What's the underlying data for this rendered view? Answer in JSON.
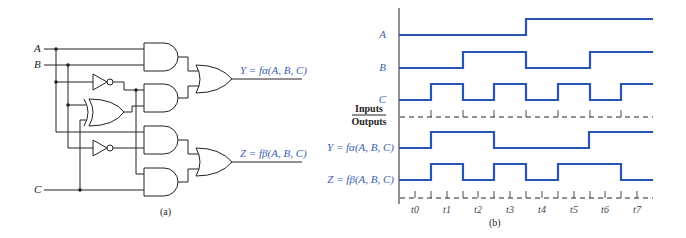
{
  "circuit": {
    "caption": "(a)",
    "inputs": [
      "A",
      "B",
      "C"
    ],
    "outputs": [
      {
        "name": "Y",
        "label": "Y = fα(A, B, C)"
      },
      {
        "name": "Z",
        "label": "Z = fβ(A, B, C)"
      }
    ],
    "gates": [
      "AND",
      "AND",
      "AND",
      "AND",
      "NOT",
      "NOT",
      "XOR",
      "OR",
      "OR"
    ]
  },
  "timing": {
    "caption": "(b)",
    "inputs_label": "Inputs",
    "outputs_label": "Outputs",
    "signals": [
      {
        "name": "A",
        "label": "A",
        "values": [
          0,
          0,
          0,
          0,
          1,
          1,
          1,
          1
        ]
      },
      {
        "name": "B",
        "label": "B",
        "values": [
          0,
          0,
          1,
          1,
          0,
          0,
          1,
          1
        ]
      },
      {
        "name": "C",
        "label": "C",
        "values": [
          0,
          1,
          0,
          1,
          0,
          1,
          0,
          1
        ]
      },
      {
        "name": "Y",
        "label": "Y = fα(A, B, C)",
        "values": [
          0,
          1,
          1,
          0,
          0,
          0,
          1,
          1
        ]
      },
      {
        "name": "Z",
        "label": "Z = fβ(A, B, C)",
        "values": [
          0,
          1,
          0,
          1,
          0,
          1,
          1,
          0
        ]
      }
    ],
    "time_labels": [
      "t0",
      "t1",
      "t2",
      "t3",
      "t4",
      "t5",
      "t6",
      "t7"
    ],
    "wave_color": "#2a55b5"
  }
}
